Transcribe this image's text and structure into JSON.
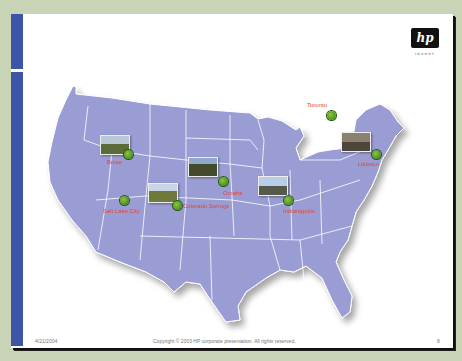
{
  "slide": {
    "logo": {
      "text": "hp",
      "tagline": "invent"
    },
    "map": {
      "fill_color": "#9a9dd4",
      "border_color": "#ffffff",
      "cities": [
        {
          "name": "Boise",
          "label_x": 107,
          "label_y": 161,
          "dot_x": 128,
          "dot_y": 154
        },
        {
          "name": "Salt Lake City",
          "label_x": 103,
          "label_y": 210,
          "dot_x": 124,
          "dot_y": 200
        },
        {
          "name": "Colorado Springs",
          "label_x": 183,
          "label_y": 205,
          "dot_x": 177,
          "dot_y": 205
        },
        {
          "name": "Omaha",
          "label_x": 223,
          "label_y": 192,
          "dot_x": 223,
          "dot_y": 181
        },
        {
          "name": "Indianapolis",
          "label_x": 283,
          "label_y": 211,
          "dot_x": 288,
          "dot_y": 200
        },
        {
          "name": "Toronto",
          "label_x": 307,
          "label_y": 105,
          "dot_x": 331,
          "dot_y": 115
        },
        {
          "name": "Littleton",
          "label_x": 358,
          "label_y": 163,
          "dot_x": 376,
          "dot_y": 154
        }
      ],
      "photos": [
        {
          "x": 100,
          "y": 135,
          "colors": [
            "#b9c7d8",
            "#5b6b3a"
          ]
        },
        {
          "x": 148,
          "y": 183,
          "colors": [
            "#c9d4e4",
            "#6d7a3a"
          ]
        },
        {
          "x": 188,
          "y": 157,
          "colors": [
            "#8fa9c9",
            "#444a2c"
          ]
        },
        {
          "x": 258,
          "y": 176,
          "colors": [
            "#b9cde9",
            "#555a4a"
          ]
        },
        {
          "x": 341,
          "y": 132,
          "colors": [
            "#8a8170",
            "#4d463a"
          ]
        }
      ]
    },
    "footer": {
      "date": "4/21/2004",
      "copyright": "Copyright © 2003 HP corporate presentation. All rights reserved.",
      "page_number": "8"
    }
  }
}
